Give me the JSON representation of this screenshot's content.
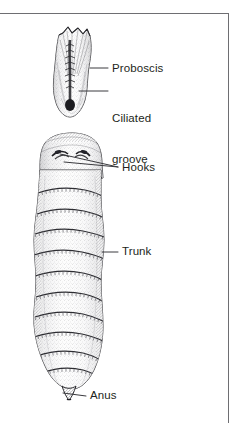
{
  "figure": {
    "kind": "anatomical-line-drawing",
    "background_color": "#ffffff",
    "ink_color": "#231f20",
    "rule_color": "#6e6e72"
  },
  "frame": {
    "top_rule_name": "top-border-rule",
    "right_rule_name": "right-border-rule"
  },
  "labels": [
    {
      "id": "proboscis",
      "text": "Proboscis"
    },
    {
      "id": "ciliated_line1",
      "text": "Ciliated"
    },
    {
      "id": "ciliated_line2",
      "text": "groove"
    },
    {
      "id": "hooks",
      "text": "Hooks"
    },
    {
      "id": "trunk",
      "text": "Trunk"
    },
    {
      "id": "anus",
      "text": "Anus"
    }
  ],
  "label_text": {
    "proboscis": "Proboscis",
    "ciliated_groove_line1": "Ciliated",
    "ciliated_groove_line2": "groove",
    "hooks": "Hooks",
    "trunk": "Trunk",
    "anus": "Anus"
  },
  "anatomy_parts": [
    {
      "name": "proboscis",
      "description": "elongated bulb with star-shaped crown at apex",
      "label": "Proboscis"
    },
    {
      "name": "ciliated-groove",
      "description": "dark median groove running down the proboscis ending in a dark terminal pore",
      "label": "Ciliated groove"
    },
    {
      "name": "collar",
      "description": "smooth band below the proboscis bearing paired hooks",
      "label": "Hooks"
    },
    {
      "name": "hooks",
      "description": "paired curved hooks on the collar",
      "label": "Hooks"
    },
    {
      "name": "trunk",
      "description": "long annulated body with transverse segment bands",
      "label": "Trunk",
      "band_count": 11
    },
    {
      "name": "anus",
      "description": "small tapered terminal papilla at the posterior end",
      "label": "Anus"
    }
  ]
}
